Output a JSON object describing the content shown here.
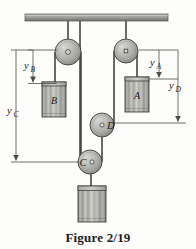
{
  "figure": {
    "caption": "Figure 2/19",
    "background_color": "#fdfdfc"
  },
  "labels": {
    "block_a": "A",
    "block_b": "B",
    "pulley_c": "C",
    "pulley_d": "D",
    "dim_ya_main": "y",
    "dim_ya_sub": "A",
    "dim_yb_main": "y",
    "dim_yb_sub": "B",
    "dim_yc_main": "y",
    "dim_yc_sub": "C",
    "dim_yd_main": "y",
    "dim_yd_sub": "D"
  },
  "colors": {
    "ceiling_fill": "#9a9a96",
    "ceiling_stroke": "#4a4a46",
    "pulley_fill": "#b4b4ae",
    "pulley_stroke": "#3c3c38",
    "block_fill": "#b0b0aa",
    "block_stroke": "#2e2e2a",
    "rope": "#3a3a36",
    "dimension_line": "#4b4b47",
    "text": "#1a1a1a"
  },
  "geometry": {
    "ceiling": {
      "x": 25,
      "y": 14,
      "width": 143,
      "height": 7
    },
    "pulleys": [
      {
        "name": "left-ceiling-pulley",
        "cx": 68,
        "cy": 52,
        "r": 13
      },
      {
        "name": "right-ceiling-pulley",
        "cx": 126,
        "cy": 51,
        "r": 12
      },
      {
        "name": "pulley-d",
        "cx": 102,
        "cy": 125,
        "r": 12
      },
      {
        "name": "pulley-c",
        "cx": 90,
        "cy": 162,
        "r": 12
      }
    ],
    "blocks": [
      {
        "name": "block-b",
        "x": 42,
        "y": 82,
        "width": 24,
        "height": 35
      },
      {
        "name": "block-a",
        "x": 125,
        "y": 77,
        "width": 24,
        "height": 35
      },
      {
        "name": "block-bottom",
        "x": 78,
        "y": 186,
        "width": 28,
        "height": 36
      }
    ],
    "dimensions": [
      {
        "name": "y-b",
        "x": 33,
        "top": 50,
        "bottom": 83
      },
      {
        "name": "y-c",
        "x": 16,
        "top": 50,
        "bottom": 160
      },
      {
        "name": "y-a",
        "x": 159,
        "top": 50,
        "bottom": 78
      },
      {
        "name": "y-d",
        "x": 178,
        "top": 50,
        "bottom": 122
      }
    ]
  }
}
